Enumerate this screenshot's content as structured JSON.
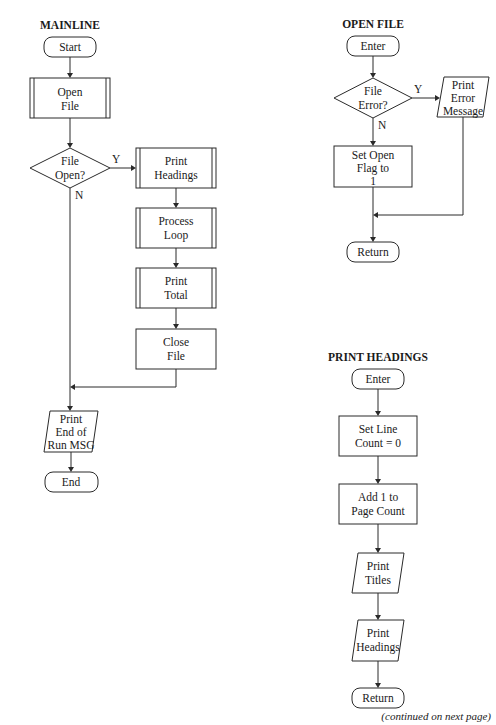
{
  "diagrams": {
    "mainline": {
      "title": "MAINLINE",
      "start": "Start",
      "open_file": [
        "Open",
        "File"
      ],
      "decision": [
        "File",
        "Open?"
      ],
      "yes": "Y",
      "no": "N",
      "print_headings": [
        "Print",
        "Headings"
      ],
      "process_loop": [
        "Process",
        "Loop"
      ],
      "print_total": [
        "Print",
        "Total"
      ],
      "close_file": [
        "Close",
        "File"
      ],
      "print_end": [
        "Print",
        "End of",
        "Run MSG"
      ],
      "end": "End"
    },
    "open_file": {
      "title": "OPEN FILE",
      "enter": "Enter",
      "decision": [
        "File",
        "Error?"
      ],
      "yes": "Y",
      "no": "N",
      "print_error": [
        "Print",
        "Error",
        "Message"
      ],
      "set_flag": [
        "Set Open",
        "Flag to",
        "1"
      ],
      "return": "Return"
    },
    "print_headings": {
      "title": "PRINT HEADINGS",
      "enter": "Enter",
      "set_line": [
        "Set Line",
        "Count = 0"
      ],
      "add_page": [
        "Add 1 to",
        "Page Count"
      ],
      "print_titles": [
        "Print",
        "Titles"
      ],
      "print_headings": [
        "Print",
        "Headings"
      ],
      "return": "Return"
    }
  },
  "footer": "(continued on next page)"
}
